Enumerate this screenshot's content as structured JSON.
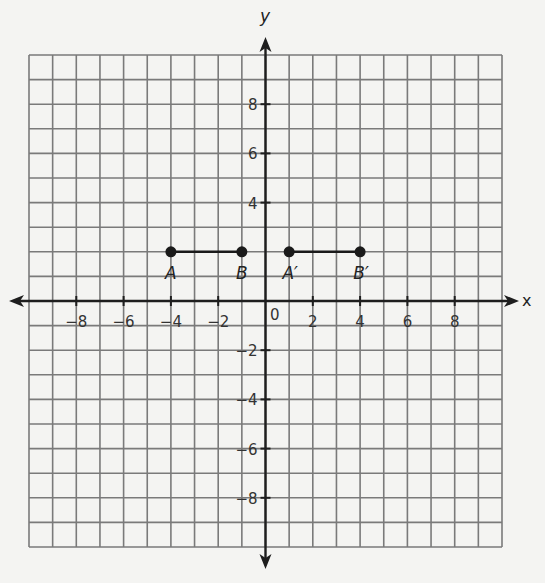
{
  "chart_data": {
    "type": "scatter",
    "title": "",
    "xlabel": "x",
    "ylabel": "y",
    "xlim": [
      -10,
      10
    ],
    "ylim": [
      -10,
      10
    ],
    "grid": true,
    "grid_step": 1,
    "x_tick_labels": [
      "-8",
      "-6",
      "-4",
      "-2",
      "0",
      "2",
      "4",
      "6",
      "8"
    ],
    "y_tick_labels": [
      "8",
      "6",
      "4",
      "2",
      "-2",
      "-4",
      "-6",
      "-8"
    ],
    "points": [
      {
        "label": "A",
        "x": -4,
        "y": 2
      },
      {
        "label": "B",
        "x": -1,
        "y": 2
      },
      {
        "label": "A′",
        "x": 1,
        "y": 2
      },
      {
        "label": "B′",
        "x": 4,
        "y": 2
      }
    ],
    "segments": [
      {
        "name": "AB",
        "from": "A",
        "to": "B"
      },
      {
        "name": "A′B′",
        "from": "A′",
        "to": "B′"
      }
    ]
  },
  "labels": {
    "x_axis": "x",
    "y_axis": "y",
    "origin": "0",
    "xticks": [
      "−8",
      "−6",
      "−4",
      "−2",
      "2",
      "4",
      "6",
      "8"
    ],
    "yticks": [
      "8",
      "6",
      "4",
      "−2",
      "−4",
      "−6",
      "−8"
    ],
    "points": [
      "A",
      "B",
      "A′",
      "B′"
    ]
  },
  "colors": {
    "grid": "#7a7a7a",
    "axis": "#1e1e1e",
    "point": "#1a1a1a",
    "background": "#f4f4f2"
  }
}
